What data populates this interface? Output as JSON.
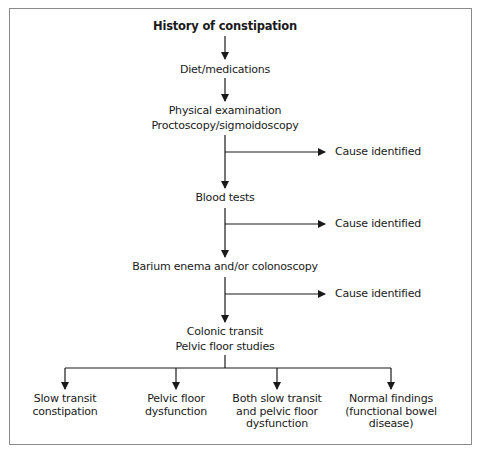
{
  "diagram": {
    "title": "History of constipation",
    "steps": [
      {
        "id": "diet",
        "lines": [
          "Diet/medications"
        ]
      },
      {
        "id": "physical",
        "lines": [
          "Physical examination",
          "Proctoscopy/sigmoidoscopy"
        ]
      },
      {
        "id": "blood",
        "lines": [
          "Blood tests"
        ]
      },
      {
        "id": "barium",
        "lines": [
          "Barium enema and/or colonoscopy"
        ]
      },
      {
        "id": "colonic",
        "lines": [
          "Colonic transit",
          "Pelvic floor studies"
        ]
      }
    ],
    "branches": [
      {
        "from": "physical",
        "label": "Cause identified"
      },
      {
        "from": "blood",
        "label": "Cause identified"
      },
      {
        "from": "barium",
        "label": "Cause identified"
      }
    ],
    "outcomes": [
      {
        "id": "slow-transit",
        "lines": [
          "Slow transit",
          "constipation"
        ]
      },
      {
        "id": "pelvic-floor",
        "lines": [
          "Pelvic floor",
          "dysfunction"
        ]
      },
      {
        "id": "both",
        "lines": [
          "Both slow transit",
          "and pelvic floor",
          "dysfunction"
        ]
      },
      {
        "id": "normal",
        "lines": [
          "Normal findings",
          "(functional bowel",
          "disease)"
        ]
      }
    ],
    "colors": {
      "line": "#1a1a1a",
      "frame": "#8a8a8a",
      "text": "#1a1a1a"
    }
  }
}
